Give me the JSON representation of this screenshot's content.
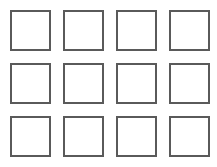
{
  "grid": {
    "rows": 3,
    "columns": 4,
    "cells": [
      {
        "row": 1,
        "col": 1,
        "filled": false
      },
      {
        "row": 1,
        "col": 2,
        "filled": false
      },
      {
        "row": 1,
        "col": 3,
        "filled": false
      },
      {
        "row": 1,
        "col": 4,
        "filled": false
      },
      {
        "row": 2,
        "col": 1,
        "filled": false
      },
      {
        "row": 2,
        "col": 2,
        "filled": false
      },
      {
        "row": 2,
        "col": 3,
        "filled": false
      },
      {
        "row": 2,
        "col": 4,
        "filled": false
      },
      {
        "row": 3,
        "col": 1,
        "filled": false
      },
      {
        "row": 3,
        "col": 2,
        "filled": false
      },
      {
        "row": 3,
        "col": 3,
        "filled": false
      },
      {
        "row": 3,
        "col": 4,
        "filled": false
      }
    ],
    "border_color": "#5a5a5a",
    "fill_color": "#ffffff"
  }
}
